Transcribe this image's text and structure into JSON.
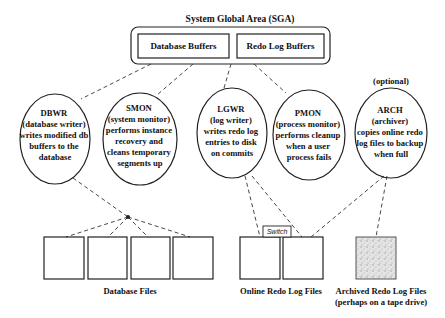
{
  "sga": {
    "title": "System Global Area (SGA)",
    "buffers": [
      {
        "id": "database-buffers",
        "label": "Database Buffers"
      },
      {
        "id": "redo-log-buffers",
        "label": "Redo Log Buffers"
      }
    ]
  },
  "processes": [
    {
      "id": "dbwr",
      "name": "DBWR",
      "lines": [
        "(database writer)",
        "writes modified db",
        "buffers to the",
        "database"
      ]
    },
    {
      "id": "smon",
      "name": "SMON",
      "lines": [
        "(system monitor)",
        "performs instance",
        "recovery and",
        "cleans temporary",
        "segments up"
      ]
    },
    {
      "id": "lgwr",
      "name": "LGWR",
      "lines": [
        "(log writer)",
        "writes redo log",
        "entries to disk",
        "on commits"
      ]
    },
    {
      "id": "pmon",
      "name": "PMON",
      "lines": [
        "(process monitor)",
        "performs cleanup",
        "when a user",
        "process fails"
      ]
    },
    {
      "id": "arch",
      "name": "ARCH",
      "note": "(optional)",
      "lines": [
        "(archiver)",
        "copies online redo",
        "log files to backup",
        "when full"
      ]
    }
  ],
  "storage": {
    "database_files": {
      "label": "Database Files",
      "count": 4
    },
    "online_redo_log_files": {
      "label": "Online Redo Log Files",
      "count": 2,
      "switch_label": "Switch"
    },
    "archived_redo_log_files": {
      "label": "Archived Redo Log Files",
      "sublabel": "(perhaps on a tape drive)",
      "count": 1
    }
  },
  "colors": {
    "line": "#222222",
    "archive_fill": "#d8d8d8"
  }
}
